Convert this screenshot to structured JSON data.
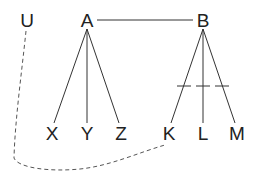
{
  "diagram": {
    "type": "tree",
    "nodes": [
      {
        "id": "U",
        "label": "U",
        "x": 27,
        "y": 20
      },
      {
        "id": "A",
        "label": "A",
        "x": 87,
        "y": 20
      },
      {
        "id": "B",
        "label": "B",
        "x": 203,
        "y": 20
      },
      {
        "id": "X",
        "label": "X",
        "x": 52,
        "y": 133
      },
      {
        "id": "Y",
        "label": "Y",
        "x": 87,
        "y": 133
      },
      {
        "id": "Z",
        "label": "Z",
        "x": 121,
        "y": 133
      },
      {
        "id": "K",
        "label": "K",
        "x": 169,
        "y": 133
      },
      {
        "id": "L",
        "label": "L",
        "x": 203,
        "y": 133
      },
      {
        "id": "M",
        "label": "M",
        "x": 237,
        "y": 133
      }
    ],
    "edges": [
      {
        "from": "A",
        "to": "B",
        "style": "solid"
      },
      {
        "from": "A",
        "to": "X",
        "style": "solid"
      },
      {
        "from": "A",
        "to": "Y",
        "style": "solid"
      },
      {
        "from": "A",
        "to": "Z",
        "style": "solid"
      },
      {
        "from": "B",
        "to": "K",
        "style": "solid",
        "tick": true
      },
      {
        "from": "B",
        "to": "L",
        "style": "solid",
        "tick": true
      },
      {
        "from": "B",
        "to": "M",
        "style": "solid",
        "tick": true
      },
      {
        "from": "U",
        "to": "K",
        "style": "dashed",
        "curved": true
      }
    ]
  }
}
